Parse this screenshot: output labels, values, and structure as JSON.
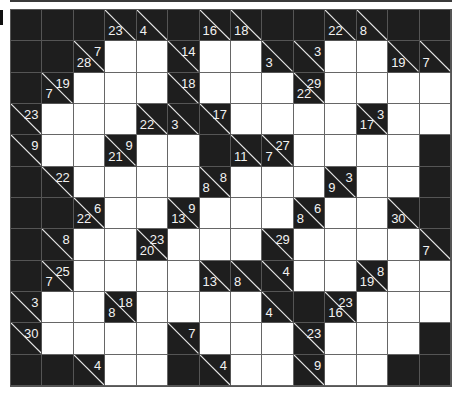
{
  "puzzle": {
    "type": "kakuro",
    "rows": 12,
    "cols": 14,
    "legend": "Cell codes: B = black, W = white (empty entry), clue = {d: down-sum, r: right-sum}",
    "grid": [
      [
        "B",
        "B",
        "B",
        {
          "d": 23
        },
        {
          "d": 4
        },
        "B",
        {
          "d": 16
        },
        {
          "d": 18
        },
        "B",
        "B",
        {
          "d": 22
        },
        {
          "d": 8
        },
        "B",
        "B"
      ],
      [
        "B",
        "B",
        {
          "d": 28,
          "r": 7
        },
        "W",
        "W",
        {
          "r": 14
        },
        "W",
        "W",
        {
          "d": 3
        },
        {
          "r": 3
        },
        "W",
        "W",
        {
          "d": 19
        },
        {
          "d": 7
        }
      ],
      [
        "B",
        {
          "d": 7,
          "r": 19
        },
        "W",
        "W",
        "W",
        {
          "r": 18
        },
        "W",
        "W",
        "W",
        {
          "d": 22,
          "r": 29
        },
        "W",
        "W",
        "W",
        "W"
      ],
      [
        {
          "r": 23
        },
        "W",
        "W",
        "W",
        {
          "d": 22
        },
        {
          "d": 3
        },
        {
          "r": 17
        },
        "W",
        "W",
        "W",
        "W",
        {
          "d": 17,
          "r": 3
        },
        "W",
        "W"
      ],
      [
        {
          "r": 9
        },
        "W",
        "W",
        {
          "d": 21,
          "r": 9
        },
        "W",
        "W",
        "B",
        {
          "d": 11
        },
        {
          "d": 7,
          "r": 27
        },
        "W",
        "W",
        "W",
        "W",
        "B"
      ],
      [
        "B",
        {
          "r": 22
        },
        "W",
        "W",
        "W",
        "W",
        {
          "d": 8,
          "r": 8
        },
        "W",
        "W",
        "W",
        {
          "d": 9,
          "r": 3
        },
        "W",
        "W",
        "B"
      ],
      [
        "B",
        "B",
        {
          "d": 22,
          "r": 6
        },
        "W",
        "W",
        {
          "d": 13,
          "r": 9
        },
        "W",
        "W",
        "W",
        {
          "d": 8,
          "r": 6
        },
        "W",
        "W",
        {
          "d": 30
        },
        "B"
      ],
      [
        "B",
        {
          "r": 8
        },
        "W",
        "W",
        {
          "d": 20,
          "r": 23
        },
        "W",
        "W",
        "W",
        {
          "r": 29
        },
        "W",
        "W",
        "W",
        "W",
        {
          "d": 7
        }
      ],
      [
        "B",
        {
          "d": 7,
          "r": 25
        },
        "W",
        "W",
        "W",
        "W",
        {
          "d": 13
        },
        {
          "d": 8
        },
        {
          "r": 4
        },
        "W",
        "W",
        {
          "d": 19,
          "r": 8
        },
        "W",
        "W"
      ],
      [
        {
          "r": 3
        },
        "W",
        "W",
        {
          "d": 8,
          "r": 18
        },
        "W",
        "W",
        "W",
        "W",
        {
          "d": 4
        },
        "B",
        {
          "d": 16,
          "r": 23
        },
        "W",
        "W",
        "W"
      ],
      [
        {
          "r": 30
        },
        "W",
        "W",
        "W",
        "W",
        {
          "r": 7
        },
        "W",
        "W",
        "W",
        {
          "r": 23
        },
        "W",
        "W",
        "W",
        "B"
      ],
      [
        "B",
        "B",
        {
          "r": 4
        },
        "W",
        "W",
        "B",
        {
          "r": 4
        },
        "W",
        "W",
        {
          "r": 9
        },
        "W",
        "W",
        "B",
        "B"
      ]
    ]
  },
  "colors": {
    "black_cell": "#1e1e1e",
    "white_cell": "#ffffff",
    "clue_text": "#f2f2f2",
    "grid_line": "#555555"
  }
}
